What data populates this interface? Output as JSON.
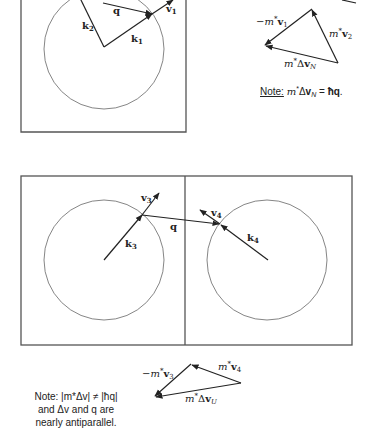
{
  "figure_top": {
    "vectors": {
      "k1": {
        "label": "k",
        "sub": "1"
      },
      "k2": {
        "label": "k",
        "sub": "2"
      },
      "q": {
        "label": "q"
      },
      "v1": {
        "label": "v",
        "sub": "1"
      }
    },
    "triangle": {
      "neg_mv1": {
        "prefix": "−m",
        "star": "*",
        "vec": "v",
        "sub": "1"
      },
      "mv2": {
        "prefix": "m",
        "star": "*",
        "vec": "v",
        "sub": "2"
      },
      "mdv": {
        "prefix": "m",
        "star": "*",
        "delta": "Δ",
        "vec": "v",
        "sub": "N"
      }
    },
    "note": {
      "label": "Note:",
      "lhs_prefix": "m",
      "lhs_star": "*",
      "lhs_delta": "Δ",
      "lhs_vec": "v",
      "lhs_sub": "N",
      "eq": " = ",
      "rhs": "ħq",
      "end": "."
    }
  },
  "figure_bottom": {
    "vectors": {
      "k3": {
        "label": "k",
        "sub": "3"
      },
      "k4": {
        "label": "k",
        "sub": "4"
      },
      "q": {
        "label": "q"
      },
      "v3": {
        "label": "v",
        "sub": "3"
      },
      "v4": {
        "label": "v",
        "sub": "4"
      }
    },
    "triangle": {
      "neg_mv3": {
        "prefix": "−m",
        "star": "*",
        "vec": "v",
        "sub": "3"
      },
      "mv4": {
        "prefix": "m",
        "star": "*",
        "vec": "v",
        "sub": "4"
      },
      "mdv": {
        "prefix": "m",
        "star": "*",
        "delta": "Δ",
        "vec": "v",
        "sub": "U"
      }
    },
    "note": {
      "line1": "Note: |m*Δv| ≠ |ħq|",
      "line2": "and Δv and q are",
      "line3": "nearly antiparallel."
    }
  }
}
